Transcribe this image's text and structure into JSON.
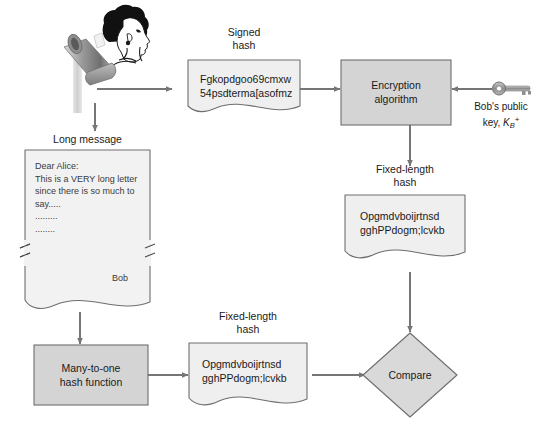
{
  "diagram": {
    "labels": {
      "signed_hash": "Signed\nhash",
      "long_message": "Long message",
      "fixed_length_hash_right": "Fixed-length\nhash",
      "fixed_length_hash_bottom": "Fixed-length\nhash",
      "bobs_public_key_line1": "Bob's public",
      "bobs_public_key_line2_prefix": "key, ",
      "bobs_public_key_symbol": "K",
      "bobs_public_key_subscript": "B",
      "bobs_public_key_superscript": "+"
    },
    "nodes": {
      "signed_hash_doc": {
        "kind": "document",
        "line1": "Fgkopdgoo69cmxw",
        "line2": "54psdterma[asofmz"
      },
      "encryption_algorithm": {
        "kind": "process",
        "line1": "Encryption",
        "line2": "algorithm"
      },
      "fixed_hash_doc_right": {
        "kind": "document",
        "line1": "Opgmdvboijrtnsd",
        "line2": "gghPPdogm;lcvkb"
      },
      "long_message_doc": {
        "kind": "torn-document",
        "line1": "Dear Alice:",
        "line2": "This is a VERY long letter",
        "line3": "since there is so much to",
        "line4": "say.....",
        "line5": ".........",
        "line6": "........",
        "signature": "Bob"
      },
      "hash_function": {
        "kind": "process",
        "line1": "Many-to-one",
        "line2": "hash function"
      },
      "fixed_hash_doc_bottom": {
        "kind": "document",
        "line1": "Opgmdvboijrtnsd",
        "line2": "gghPPdogm;lcvkb"
      },
      "compare": {
        "kind": "decision",
        "label": "Compare"
      }
    },
    "icons": {
      "person": "bob-person-icon",
      "mailbox": "mailbox-icon",
      "key": "key-icon"
    },
    "colors": {
      "process_fill": "#d4d4d4",
      "document_fill": "#efefef",
      "decision_fill": "#d9d9d9",
      "stroke": "#6e6e6e",
      "arrow": "#767676",
      "text": "#1a1a1a"
    }
  }
}
